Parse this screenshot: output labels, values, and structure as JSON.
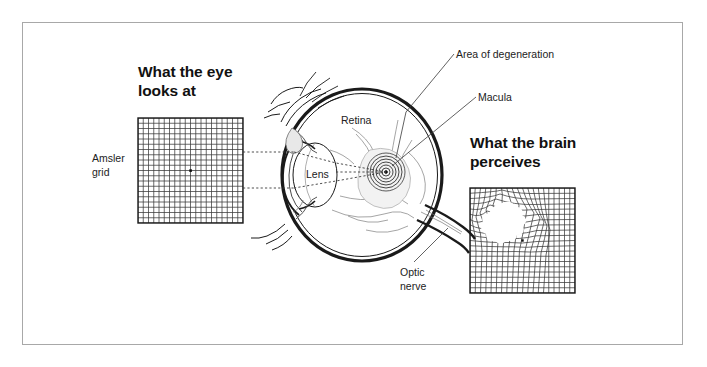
{
  "figure": {
    "title_left": "What the eye\nlooks at",
    "title_right": "What the brain\nperceives",
    "border_color": "#a8a8a8",
    "ink_color": "#1a1a1a"
  },
  "labels": {
    "amsler_grid": "Amsler\ngrid",
    "retina": "Retina",
    "lens": "Lens",
    "area_of_degeneration": "Area of degeneration",
    "macula": "Macula",
    "optic_nerve": "Optic\nnerve"
  },
  "diagram": {
    "type": "medical-illustration",
    "normal_grid": {
      "name": "amsler-grid-normal",
      "cells_x": 20,
      "cells_y": 20,
      "x": 138,
      "y": 118,
      "size": 105,
      "center_dot": true,
      "distorted": false
    },
    "perceived_grid": {
      "name": "amsler-grid-distorted",
      "cells_x": 20,
      "cells_y": 20,
      "x": 470,
      "y": 188,
      "size": 105,
      "center_dot": true,
      "distorted": true,
      "scotoma": {
        "label": "blind-spot",
        "center_x": 502,
        "center_y": 218,
        "radius": 15
      }
    },
    "eye": {
      "globe_center_x": 362,
      "globe_center_y": 175,
      "globe_rx": 78,
      "globe_ry": 85,
      "macula_center_x": 386,
      "macula_center_y": 172,
      "macula_rings": 7,
      "optic_nerve_angle_deg": 28
    },
    "sight_lines": {
      "style": "dashed",
      "from_grid_top_y": 152,
      "from_grid_bottom_y": 188,
      "converge_x": 386,
      "converge_y": 172
    }
  }
}
